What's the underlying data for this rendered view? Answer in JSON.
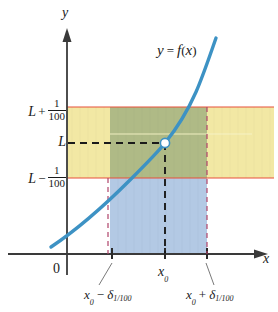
{
  "figure": {
    "type": "epsilon-delta-limit-diagram",
    "axes": {
      "x_axis_label": "x",
      "y_axis_label": "y",
      "origin_label": "0"
    },
    "curve": {
      "label_y": "y",
      "label_equals": "=",
      "label_f": "f",
      "label_paren_open": "(",
      "label_var": "x",
      "label_paren_close": ")",
      "color": "#3d92c4"
    },
    "y_ticks": [
      {
        "id": "upper-bound",
        "lead": "L",
        "operator": "+",
        "numerator": "1",
        "denominator": "100",
        "full_text": "L + 1/100"
      },
      {
        "id": "limit",
        "lead": "L",
        "operator": "",
        "numerator": "",
        "denominator": "",
        "full_text": "L"
      },
      {
        "id": "lower-bound",
        "lead": "L",
        "operator": "−",
        "numerator": "1",
        "denominator": "100",
        "full_text": "L − 1/100"
      }
    ],
    "x_ticks": [
      {
        "id": "x0-minus-delta",
        "base": "x",
        "base_sub": "0",
        "operator": "−",
        "symbol": "δ",
        "symbol_sub": "1/100",
        "full_text": "x0 − δ1/100"
      },
      {
        "id": "x0",
        "base": "x",
        "base_sub": "0",
        "operator": "",
        "symbol": "",
        "symbol_sub": "",
        "full_text": "x0"
      },
      {
        "id": "x0-plus-delta",
        "base": "x",
        "base_sub": "0",
        "operator": "+",
        "symbol": "δ",
        "symbol_sub": "1/100",
        "full_text": "x0 + δ1/100"
      }
    ],
    "colors": {
      "curve": "#3d92c4",
      "horizontal_band": "#f0e49a",
      "vertical_band": "#aac4e2",
      "overlap_band": "#9aab7e",
      "band_border_red": "#e8503a",
      "delta_dashed": "#b0446a",
      "axis": "#3a3a3a",
      "point_fill": "#ffffff",
      "point_stroke": "#3d92c4",
      "dashed_black": "#1a1a1a"
    }
  }
}
